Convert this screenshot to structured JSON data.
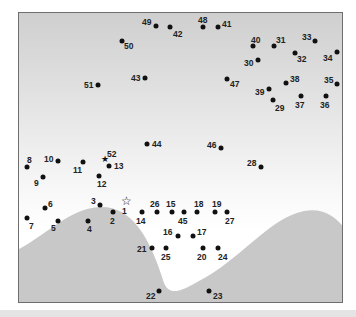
{
  "puzzle": {
    "type": "connect-the-dots",
    "colors": {
      "sky_top": "#cfcfcf",
      "sky_bottom": "#ffffff",
      "hills": "#c8c8c8",
      "dots": "#111111",
      "border": "#6e6e6e"
    },
    "start_marker": "star-outline",
    "end_marker": "star-filled",
    "points": [
      {
        "n": "1",
        "x": 126,
        "y": 201,
        "shape": "star-outline",
        "lx": 122,
        "ly": 207
      },
      {
        "n": "2",
        "x": 113,
        "y": 212,
        "lx": 110,
        "ly": 217
      },
      {
        "n": "3",
        "x": 100,
        "y": 205,
        "lx": 91,
        "ly": 197
      },
      {
        "n": "4",
        "x": 88,
        "y": 221,
        "lx": 87,
        "ly": 225
      },
      {
        "n": "5",
        "x": 58,
        "y": 221,
        "lx": 51,
        "ly": 224
      },
      {
        "n": "6",
        "x": 45,
        "y": 208,
        "lx": 48,
        "ly": 200
      },
      {
        "n": "7",
        "x": 27,
        "y": 218,
        "lx": 29,
        "ly": 222
      },
      {
        "n": "8",
        "x": 27,
        "y": 167,
        "lx": 27,
        "ly": 156
      },
      {
        "n": "9",
        "x": 43,
        "y": 177,
        "lx": 34,
        "ly": 179
      },
      {
        "n": "10",
        "x": 58,
        "y": 161,
        "lx": 44,
        "ly": 155
      },
      {
        "n": "11",
        "x": 83,
        "y": 162,
        "lx": 73,
        "ly": 166
      },
      {
        "n": "12",
        "x": 99,
        "y": 176,
        "lx": 97,
        "ly": 180
      },
      {
        "n": "13",
        "x": 109,
        "y": 166,
        "lx": 114,
        "ly": 162
      },
      {
        "n": "14",
        "x": 142,
        "y": 212,
        "lx": 136,
        "ly": 217
      },
      {
        "n": "15",
        "x": 172,
        "y": 212,
        "lx": 166,
        "ly": 200
      },
      {
        "n": "16",
        "x": 178,
        "y": 236,
        "lx": 163,
        "ly": 228
      },
      {
        "n": "17",
        "x": 193,
        "y": 236,
        "lx": 197,
        "ly": 228
      },
      {
        "n": "18",
        "x": 197,
        "y": 212,
        "lx": 194,
        "ly": 200
      },
      {
        "n": "19",
        "x": 215,
        "y": 212,
        "lx": 212,
        "ly": 200
      },
      {
        "n": "20",
        "x": 203,
        "y": 248,
        "lx": 197,
        "ly": 253
      },
      {
        "n": "21",
        "x": 152,
        "y": 248,
        "lx": 137,
        "ly": 245
      },
      {
        "n": "22",
        "x": 159,
        "y": 291,
        "lx": 146,
        "ly": 292
      },
      {
        "n": "23",
        "x": 209,
        "y": 291,
        "lx": 213,
        "ly": 292
      },
      {
        "n": "24",
        "x": 218,
        "y": 248,
        "lx": 218,
        "ly": 253
      },
      {
        "n": "25",
        "x": 166,
        "y": 248,
        "lx": 161,
        "ly": 253
      },
      {
        "n": "26",
        "x": 157,
        "y": 212,
        "lx": 150,
        "ly": 200
      },
      {
        "n": "27",
        "x": 227,
        "y": 212,
        "lx": 225,
        "ly": 217
      },
      {
        "n": "28",
        "x": 261,
        "y": 167,
        "lx": 247,
        "ly": 159
      },
      {
        "n": "29",
        "x": 273,
        "y": 100,
        "lx": 275,
        "ly": 104
      },
      {
        "n": "30",
        "x": 258,
        "y": 60,
        "lx": 244,
        "ly": 59
      },
      {
        "n": "31",
        "x": 274,
        "y": 46,
        "lx": 276,
        "ly": 36
      },
      {
        "n": "32",
        "x": 295,
        "y": 53,
        "lx": 297,
        "ly": 55
      },
      {
        "n": "33",
        "x": 315,
        "y": 41,
        "lx": 302,
        "ly": 33
      },
      {
        "n": "34",
        "x": 337,
        "y": 52,
        "lx": 323,
        "ly": 54
      },
      {
        "n": "35",
        "x": 337,
        "y": 84,
        "lx": 324,
        "ly": 76
      },
      {
        "n": "36",
        "x": 326,
        "y": 96,
        "lx": 320,
        "ly": 101
      },
      {
        "n": "37",
        "x": 301,
        "y": 96,
        "lx": 295,
        "ly": 101
      },
      {
        "n": "38",
        "x": 286,
        "y": 83,
        "lx": 290,
        "ly": 75
      },
      {
        "n": "39",
        "x": 269,
        "y": 89,
        "lx": 255,
        "ly": 88
      },
      {
        "n": "40",
        "x": 253,
        "y": 46,
        "lx": 251,
        "ly": 36
      },
      {
        "n": "41",
        "x": 218,
        "y": 27,
        "lx": 222,
        "ly": 20
      },
      {
        "n": "42",
        "x": 170,
        "y": 27,
        "lx": 173,
        "ly": 30
      },
      {
        "n": "43",
        "x": 145,
        "y": 78,
        "lx": 131,
        "ly": 74
      },
      {
        "n": "44",
        "x": 147,
        "y": 144,
        "lx": 152,
        "ly": 140
      },
      {
        "n": "45",
        "x": 184,
        "y": 212,
        "lx": 178,
        "ly": 217
      },
      {
        "n": "46",
        "x": 221,
        "y": 148,
        "lx": 207,
        "ly": 141
      },
      {
        "n": "47",
        "x": 227,
        "y": 79,
        "lx": 230,
        "ly": 80
      },
      {
        "n": "48",
        "x": 203,
        "y": 27,
        "lx": 198,
        "ly": 16
      },
      {
        "n": "49",
        "x": 156,
        "y": 26,
        "lx": 142,
        "ly": 18
      },
      {
        "n": "50",
        "x": 122,
        "y": 41,
        "lx": 124,
        "ly": 42
      },
      {
        "n": "51",
        "x": 98,
        "y": 85,
        "lx": 84,
        "ly": 81
      },
      {
        "n": "52",
        "x": 105,
        "y": 159,
        "shape": "star-filled",
        "lx": 107,
        "ly": 150
      }
    ]
  }
}
